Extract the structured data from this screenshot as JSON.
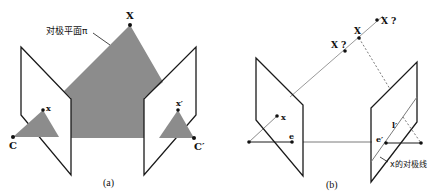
{
  "panel_a": {
    "caption": "(a)",
    "labels": {
      "X": "X",
      "plane": "对极平面π",
      "x": "x",
      "x_prime": "x′",
      "C": "C",
      "C_prime": "C′"
    },
    "colors": {
      "plane_fill": "#8c8c8c",
      "line": "#1a1a1a"
    }
  },
  "panel_b": {
    "caption": "(b)",
    "labels": {
      "X": "X",
      "X_q_upper": "X ?",
      "X_q_lower": "X ?",
      "x": "x",
      "e": "e",
      "e_prime": "e′",
      "l_prime": "l′",
      "epipolar_line": "x的对极线"
    },
    "colors": {
      "ray": "#9a9a9a",
      "line": "#1a1a1a"
    }
  }
}
